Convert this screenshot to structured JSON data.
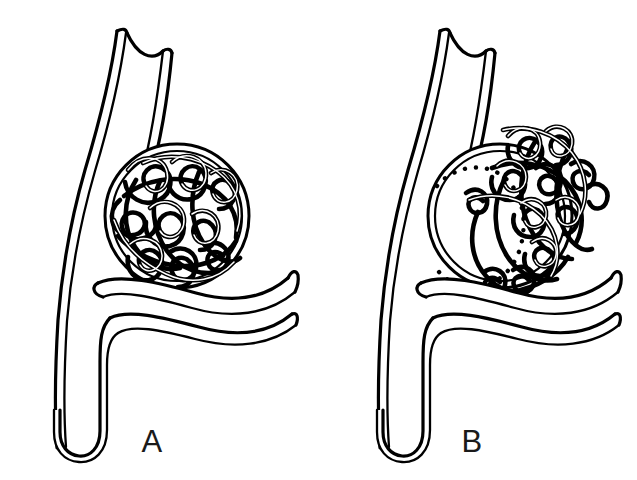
{
  "figure": {
    "background_color": "#ffffff",
    "line_color": "#000000",
    "width": 637,
    "height": 480,
    "style": "black-and-white line drawing"
  },
  "panels": [
    {
      "id": "A",
      "label": "A",
      "label_x": 152,
      "label_y": 452,
      "caption": "Aneurysm sac densely and completely packed with embolization coil",
      "sac": {
        "center_x": 177,
        "center_y": 216,
        "radius": 72,
        "packing": "dense-complete",
        "void_present": false
      }
    },
    {
      "id": "B",
      "label": "B",
      "label_x": 472,
      "label_y": 452,
      "caption": "Coil compaction with residual filling defect at the aneurysm neck",
      "sac": {
        "center_x": 500,
        "center_y": 216,
        "radius": 72,
        "packing": "compacted-peripheral",
        "void_present": true,
        "void_style": "dotted-arc"
      }
    }
  ],
  "anatomy": {
    "parent_vessel": "parent artery (double-line wall)",
    "branch_vessel": "distal branch artery",
    "aneurysm": "saccular aneurysm arising at the bifurcation",
    "coil": "platinum detachable embolization coil"
  },
  "labels": {
    "panel_a": "A",
    "panel_b": "B"
  }
}
